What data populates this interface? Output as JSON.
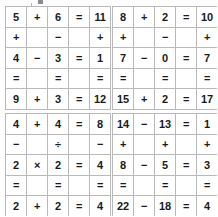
{
  "page": {
    "background_color": "#fdfdfd",
    "ink_color": "#1a1a1a",
    "faded_color": "#adadad",
    "block_color": "#1c1c1c",
    "border_color": "#b9b9b9"
  },
  "grids": [
    {
      "id": "grid-top-left",
      "rows": [
        [
          {
            "text": "5",
            "style": "given"
          },
          {
            "text": "+",
            "style": "op"
          },
          {
            "text": "6",
            "style": "given"
          },
          {
            "text": "=",
            "style": "eq"
          },
          {
            "text": "11",
            "style": "ghost"
          }
        ],
        [
          {
            "text": "+",
            "style": "op"
          },
          {
            "text": "",
            "style": "black"
          },
          {
            "text": "−",
            "style": "op"
          },
          {
            "text": "",
            "style": "black"
          },
          {
            "text": "+",
            "style": "op"
          }
        ],
        [
          {
            "text": "4",
            "style": "given"
          },
          {
            "text": "−",
            "style": "op"
          },
          {
            "text": "3",
            "style": "ghost"
          },
          {
            "text": "=",
            "style": "eq"
          },
          {
            "text": "1",
            "style": "given"
          }
        ],
        [
          {
            "text": "=",
            "style": "eq"
          },
          {
            "text": "",
            "style": "black"
          },
          {
            "text": "=",
            "style": "eq"
          },
          {
            "text": "",
            "style": "black"
          },
          {
            "text": "=",
            "style": "eq"
          }
        ],
        [
          {
            "text": "9",
            "style": "ghost"
          },
          {
            "text": "+",
            "style": "op"
          },
          {
            "text": "3",
            "style": "given"
          },
          {
            "text": "=",
            "style": "eq"
          },
          {
            "text": "12",
            "style": "ghost"
          }
        ]
      ]
    },
    {
      "id": "grid-top-right",
      "rows": [
        [
          {
            "text": "8",
            "style": "given"
          },
          {
            "text": "+",
            "style": "op"
          },
          {
            "text": "2",
            "style": "ghost"
          },
          {
            "text": "=",
            "style": "eq"
          },
          {
            "text": "10",
            "style": "given"
          }
        ],
        [
          {
            "text": "+",
            "style": "op"
          },
          {
            "text": "",
            "style": "black"
          },
          {
            "text": "−",
            "style": "op"
          },
          {
            "text": "",
            "style": "black"
          },
          {
            "text": "+",
            "style": "op"
          }
        ],
        [
          {
            "text": "7",
            "style": "ghost"
          },
          {
            "text": "−",
            "style": "op"
          },
          {
            "text": "0",
            "style": "given"
          },
          {
            "text": "=",
            "style": "eq"
          },
          {
            "text": "7",
            "style": "given"
          }
        ],
        [
          {
            "text": "=",
            "style": "eq"
          },
          {
            "text": "",
            "style": "black"
          },
          {
            "text": "=",
            "style": "eq"
          },
          {
            "text": "",
            "style": "black"
          },
          {
            "text": "=",
            "style": "eq"
          }
        ],
        [
          {
            "text": "15",
            "style": "ghost"
          },
          {
            "text": "+",
            "style": "op"
          },
          {
            "text": "2",
            "style": "given"
          },
          {
            "text": "=",
            "style": "eq"
          },
          {
            "text": "17",
            "style": "ghost"
          }
        ]
      ]
    },
    {
      "id": "grid-bottom-left",
      "rows": [
        [
          {
            "text": "4",
            "style": "ghost"
          },
          {
            "text": "+",
            "style": "op"
          },
          {
            "text": "4",
            "style": "given"
          },
          {
            "text": "=",
            "style": "eq"
          },
          {
            "text": "8",
            "style": "given"
          }
        ],
        [
          {
            "text": "−",
            "style": "op"
          },
          {
            "text": "",
            "style": "black"
          },
          {
            "text": "÷",
            "style": "op"
          },
          {
            "text": "",
            "style": "black"
          },
          {
            "text": "−",
            "style": "op"
          }
        ],
        [
          {
            "text": "2",
            "style": "given"
          },
          {
            "text": "×",
            "style": "op"
          },
          {
            "text": "2",
            "style": "ghost"
          },
          {
            "text": "=",
            "style": "eq"
          },
          {
            "text": "4",
            "style": "ghost"
          }
        ],
        [
          {
            "text": "=",
            "style": "eq"
          },
          {
            "text": "",
            "style": "black"
          },
          {
            "text": "=",
            "style": "eq"
          },
          {
            "text": "",
            "style": "black"
          },
          {
            "text": "=",
            "style": "eq"
          }
        ],
        [
          {
            "text": "2",
            "style": "ghost"
          },
          {
            "text": "+",
            "style": "op"
          },
          {
            "text": "2",
            "style": "given"
          },
          {
            "text": "=",
            "style": "eq"
          },
          {
            "text": "4",
            "style": "ghost"
          }
        ]
      ]
    },
    {
      "id": "grid-bottom-right",
      "rows": [
        [
          {
            "text": "14",
            "style": "ghost"
          },
          {
            "text": "−",
            "style": "op"
          },
          {
            "text": "13",
            "style": "given"
          },
          {
            "text": "=",
            "style": "eq"
          },
          {
            "text": "1",
            "style": "given"
          }
        ],
        [
          {
            "text": "+",
            "style": "op"
          },
          {
            "text": "",
            "style": "black"
          },
          {
            "text": "+",
            "style": "op"
          },
          {
            "text": "",
            "style": "black"
          },
          {
            "text": "+",
            "style": "op"
          }
        ],
        [
          {
            "text": "8",
            "style": "given"
          },
          {
            "text": "−",
            "style": "op"
          },
          {
            "text": "5",
            "style": "ghost"
          },
          {
            "text": "=",
            "style": "eq"
          },
          {
            "text": "3",
            "style": "given"
          }
        ],
        [
          {
            "text": "=",
            "style": "eq"
          },
          {
            "text": "",
            "style": "black"
          },
          {
            "text": "=",
            "style": "eq"
          },
          {
            "text": "",
            "style": "black"
          },
          {
            "text": "=",
            "style": "eq"
          }
        ],
        [
          {
            "text": "22",
            "style": "ghost"
          },
          {
            "text": "−",
            "style": "op"
          },
          {
            "text": "18",
            "style": "given"
          },
          {
            "text": "=",
            "style": "eq"
          },
          {
            "text": "4",
            "style": "given"
          }
        ]
      ]
    }
  ]
}
